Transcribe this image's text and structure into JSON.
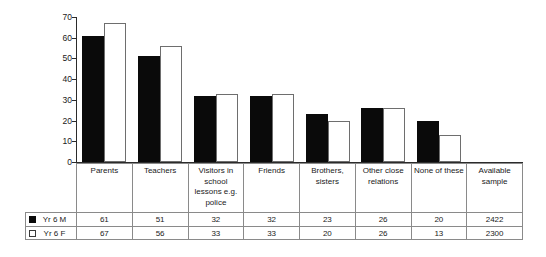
{
  "chart_data": {
    "type": "bar",
    "title": "",
    "xlabel": "",
    "ylabel": "",
    "ylim": [
      0,
      70
    ],
    "yticks": [
      0,
      10,
      20,
      30,
      40,
      50,
      60,
      70
    ],
    "ytick_labels": [
      "0",
      "10",
      "20",
      "30",
      "40",
      "50",
      "60",
      "70"
    ],
    "grid": false,
    "legend_position": "bottom-left",
    "categories": [
      "Parents",
      "Teachers",
      "Visitors in school lessons e.g. police",
      "Friends",
      "Brothers, sisters",
      "Other close relations",
      "None of these",
      "Available sample"
    ],
    "category_lines": [
      [
        "Parents"
      ],
      [
        "Teachers"
      ],
      [
        "Visitors in",
        "school",
        "lessons e.g.",
        "police"
      ],
      [
        "Friends"
      ],
      [
        "Brothers,",
        "sisters"
      ],
      [
        "Other close",
        "relations"
      ],
      [
        "None of these"
      ],
      [
        "Available",
        "sample"
      ]
    ],
    "series": [
      {
        "name": "Yr 6 M",
        "color": "#0a0a0a",
        "swatch": "filled",
        "values": [
          61,
          51,
          32,
          32,
          23,
          26,
          20,
          null
        ],
        "value_labels": [
          "61",
          "51",
          "32",
          "32",
          "23",
          "26",
          "20",
          "2422"
        ]
      },
      {
        "name": "Yr 6 F",
        "color": "#ffffff",
        "swatch": "hollow",
        "values": [
          67,
          56,
          33,
          33,
          20,
          26,
          13,
          null
        ],
        "value_labels": [
          "67",
          "56",
          "33",
          "33",
          "20",
          "26",
          "13",
          "2300"
        ]
      }
    ]
  },
  "colors": {
    "bar_male": "#0a0a0a",
    "bar_female": "#ffffff",
    "bar_female_edge": "#6e6e6e",
    "axis": "#2b2b2b",
    "table_border": "#8a8a8a",
    "text": "#1a1a1a",
    "background": "#ffffff"
  }
}
